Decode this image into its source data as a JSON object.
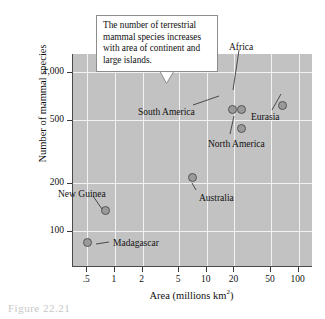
{
  "chart_data": {
    "type": "scatter",
    "title": "",
    "xlabel": "Area (millions km2)",
    "xlabel_base": "Area (millions km",
    "xlabel_sup": "2",
    "xlabel_tail": ")",
    "ylabel": "Number of mammal species",
    "xscale": "log",
    "yscale": "log",
    "xlim": [
      0.35,
      140
    ],
    "ylim": [
      60,
      1300
    ],
    "grid": true,
    "legend": "none",
    "xticks": [
      {
        "label": ".5",
        "value": 0.5
      },
      {
        "label": "1",
        "value": 1
      },
      {
        "label": "2",
        "value": 2
      },
      {
        "label": "5",
        "value": 5
      },
      {
        "label": "10",
        "value": 10
      },
      {
        "label": "20",
        "value": 20
      },
      {
        "label": "50",
        "value": 50
      },
      {
        "label": "100",
        "value": 100
      }
    ],
    "yticks": [
      {
        "label": "1,000",
        "value": 1000
      },
      {
        "label": "500",
        "value": 500
      },
      {
        "label": "200",
        "value": 200
      },
      {
        "label": "100",
        "value": 100
      }
    ],
    "points": [
      {
        "name": "Madagascar",
        "x": 0.5,
        "y": 85,
        "label": "Madagascar",
        "label_x": 113,
        "label_y": 239,
        "leader": [
          109,
          242,
          96,
          244
        ]
      },
      {
        "name": "New Guinea",
        "x": 0.79,
        "y": 135,
        "label": "New Guinea",
        "label_x": 58,
        "label_y": 190,
        "leader": [
          93,
          196,
          102,
          209
        ]
      },
      {
        "name": "Australia",
        "x": 7.0,
        "y": 216,
        "label": "Australia",
        "label_x": 199,
        "label_y": 194,
        "leader": [
          196,
          190,
          192,
          183
        ]
      },
      {
        "name": "South America",
        "x": 19,
        "y": 580,
        "label": "South America",
        "label_x": 138,
        "label_y": 108,
        "leader": [
          193,
          105,
          219,
          96
        ]
      },
      {
        "name": "Africa",
        "x": 24,
        "y": 580,
        "label": "Africa",
        "label_x": 229,
        "label_y": 43,
        "leader": [
          239,
          50,
          233,
          90
        ]
      },
      {
        "name": "North America",
        "x": 24,
        "y": 440,
        "label": "North America",
        "label_x": 208,
        "label_y": 140,
        "leader": [
          230,
          134,
          234,
          116
        ]
      },
      {
        "name": "Eurasia",
        "x": 66,
        "y": 620,
        "label": "Eurasia",
        "label_x": 251,
        "label_y": 113,
        "leader": [
          272,
          110,
          281,
          94
        ]
      }
    ]
  },
  "callout": {
    "text": "The number of terrestrial mammal species increases with area of continent and large islands."
  },
  "caption": {
    "remnant": "Figure 22.21"
  },
  "colors": {
    "plot_background": "#c2c2c2",
    "gridline": "#f2f2f2",
    "marker_fill": "#9a9a9a",
    "marker_stroke": "#555555",
    "axis": "#4a4a4a",
    "text": "#111111",
    "callout_border": "#8d8d8d",
    "callout_background": "#ffffff"
  }
}
